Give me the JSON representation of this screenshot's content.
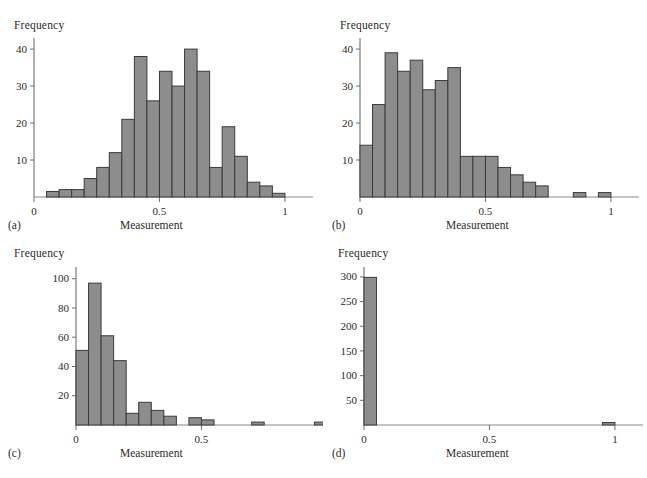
{
  "figure": {
    "background_color": "#ffffff",
    "bar_fill_color": "#8d8d8d",
    "bar_stroke_color": "#3a3a3a",
    "axis_color": "#6e6e6e",
    "text_color": "#2b2b2b"
  },
  "panels": [
    {
      "caption": "(a)",
      "ylabel": "Frequency",
      "xlabel": "Measurement",
      "ytick_labels": [
        "10",
        "20",
        "30",
        "40"
      ],
      "xtick_labels": [
        "0",
        "0.5",
        "1"
      ]
    },
    {
      "caption": "(b)",
      "ylabel": "Frequency",
      "xlabel": "Measurement",
      "ytick_labels": [
        "10",
        "20",
        "30",
        "40"
      ],
      "xtick_labels": [
        "0",
        "0.5",
        "1"
      ]
    },
    {
      "caption": "(c)",
      "ylabel": "Frequency",
      "xlabel": "Measurement",
      "ytick_labels": [
        "20",
        "40",
        "60",
        "80",
        "100"
      ],
      "xtick_labels": [
        "0",
        "0.5",
        "1"
      ]
    },
    {
      "caption": "(d)",
      "ylabel": "Frequency",
      "xlabel": "Measurement",
      "ytick_labels": [
        "50",
        "100",
        "150",
        "200",
        "250",
        "300"
      ],
      "xtick_labels": [
        "0",
        "0.5",
        "1"
      ]
    }
  ],
  "chart_data": [
    {
      "type": "bar",
      "panel": "(a)",
      "title": "",
      "xlabel": "Measurement",
      "ylabel": "Frequency",
      "bin_width": 0.05,
      "bin_starts": [
        0.0,
        0.05,
        0.1,
        0.15,
        0.2,
        0.25,
        0.3,
        0.35,
        0.4,
        0.45,
        0.5,
        0.55,
        0.6,
        0.65,
        0.7,
        0.75,
        0.8,
        0.85,
        0.9,
        0.95
      ],
      "categories": [
        "0.00-0.05",
        "0.05-0.10",
        "0.10-0.15",
        "0.15-0.20",
        "0.20-0.25",
        "0.25-0.30",
        "0.30-0.35",
        "0.35-0.40",
        "0.40-0.45",
        "0.45-0.50",
        "0.50-0.55",
        "0.55-0.60",
        "0.60-0.65",
        "0.65-0.70",
        "0.70-0.75",
        "0.75-0.80",
        "0.80-0.85",
        "0.85-0.90",
        "0.90-0.95",
        "0.95-1.00"
      ],
      "values": [
        0,
        1.5,
        2,
        2,
        5,
        8,
        12,
        21,
        38,
        26,
        34,
        30,
        40,
        34,
        8,
        19,
        11,
        4,
        3,
        1
      ],
      "xlim": [
        0,
        1.08
      ],
      "ylim": [
        0,
        43
      ],
      "yticks": [
        10,
        20,
        30,
        40
      ],
      "xticks": [
        0,
        0.5,
        1
      ],
      "grid": false,
      "legend": false
    },
    {
      "type": "bar",
      "panel": "(b)",
      "title": "",
      "xlabel": "Measurement",
      "ylabel": "Frequency",
      "bin_width": 0.05,
      "bin_starts": [
        0.0,
        0.05,
        0.1,
        0.15,
        0.2,
        0.25,
        0.3,
        0.35,
        0.4,
        0.45,
        0.5,
        0.55,
        0.6,
        0.65,
        0.7,
        0.75,
        0.8,
        0.85,
        0.9,
        0.95
      ],
      "categories": [
        "0.00-0.05",
        "0.05-0.10",
        "0.10-0.15",
        "0.15-0.20",
        "0.20-0.25",
        "0.25-0.30",
        "0.30-0.35",
        "0.35-0.40",
        "0.40-0.45",
        "0.45-0.50",
        "0.50-0.55",
        "0.55-0.60",
        "0.60-0.65",
        "0.65-0.70",
        "0.70-0.75",
        "0.75-0.80",
        "0.80-0.85",
        "0.85-0.90",
        "0.90-0.95",
        "0.95-1.00"
      ],
      "values": [
        14,
        25,
        39,
        34,
        37,
        29,
        31.5,
        35,
        11,
        11,
        11,
        8,
        6,
        4,
        3,
        0,
        0,
        1.2,
        0,
        1.2
      ],
      "xlim": [
        0,
        1.08
      ],
      "ylim": [
        0,
        43
      ],
      "yticks": [
        10,
        20,
        30,
        40
      ],
      "xticks": [
        0,
        0.5,
        1
      ],
      "grid": false,
      "legend": false
    },
    {
      "type": "bar",
      "panel": "(c)",
      "title": "",
      "xlabel": "Measurement",
      "ylabel": "Frequency",
      "bin_width": 0.05,
      "bin_starts": [
        0.0,
        0.05,
        0.1,
        0.15,
        0.2,
        0.25,
        0.3,
        0.35,
        0.4,
        0.45,
        0.5,
        0.55,
        0.6,
        0.65,
        0.7,
        0.75,
        0.8,
        0.85,
        0.9,
        0.95
      ],
      "categories": [
        "0.00-0.05",
        "0.05-0.10",
        "0.10-0.15",
        "0.15-0.20",
        "0.20-0.25",
        "0.25-0.30",
        "0.30-0.35",
        "0.35-0.40",
        "0.40-0.45",
        "0.45-0.50",
        "0.50-0.55",
        "0.55-0.60",
        "0.60-0.65",
        "0.65-0.70",
        "0.70-0.75",
        "0.75-0.80",
        "0.80-0.85",
        "0.85-0.90",
        "0.90-0.95",
        "0.95-1.00"
      ],
      "values": [
        51,
        97,
        61,
        44,
        8,
        15.5,
        10,
        6,
        0,
        5,
        3.5,
        0,
        0,
        0,
        2,
        0,
        0,
        0,
        0,
        2
      ],
      "xlim": [
        0,
        1.08
      ],
      "ylim": [
        0,
        108
      ],
      "yticks": [
        20,
        40,
        60,
        80,
        100
      ],
      "xticks": [
        0,
        0.5,
        1
      ],
      "grid": false,
      "legend": false
    },
    {
      "type": "bar",
      "panel": "(d)",
      "title": "",
      "xlabel": "Measurement",
      "ylabel": "Frequency",
      "bin_width": 0.05,
      "bin_starts": [
        0.0,
        0.05,
        0.1,
        0.15,
        0.2,
        0.25,
        0.3,
        0.35,
        0.4,
        0.45,
        0.5,
        0.55,
        0.6,
        0.65,
        0.7,
        0.75,
        0.8,
        0.85,
        0.9,
        0.95
      ],
      "categories": [
        "0.00-0.05",
        "0.05-0.10",
        "0.10-0.15",
        "0.15-0.20",
        "0.20-0.25",
        "0.25-0.30",
        "0.30-0.35",
        "0.35-0.40",
        "0.40-0.45",
        "0.45-0.50",
        "0.50-0.55",
        "0.55-0.60",
        "0.60-0.65",
        "0.65-0.70",
        "0.70-0.75",
        "0.75-0.80",
        "0.80-0.85",
        "0.85-0.90",
        "0.90-0.95",
        "0.95-1.00"
      ],
      "values": [
        299,
        0,
        0,
        0,
        0,
        0,
        0,
        0,
        0,
        0,
        0,
        0,
        0,
        0,
        0,
        0,
        0,
        0,
        0,
        5
      ],
      "xlim": [
        0,
        1.08
      ],
      "ylim": [
        0,
        320
      ],
      "yticks": [
        50,
        100,
        150,
        200,
        250,
        300
      ],
      "xticks": [
        0,
        0.5,
        1
      ],
      "grid": false,
      "legend": false
    }
  ]
}
